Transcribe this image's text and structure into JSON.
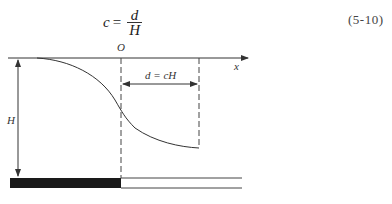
{
  "equation": {
    "lhs": "c",
    "equals": "=",
    "numerator": "d",
    "denominator": "H",
    "number": "(5-10)"
  },
  "diagram": {
    "origin_label": "O",
    "x_axis_label": "x",
    "height_label": "H",
    "distance_label": "d = cH",
    "colors": {
      "line": "#333333",
      "fill_bar": "#1a1a1a",
      "background": "#ffffff"
    }
  }
}
